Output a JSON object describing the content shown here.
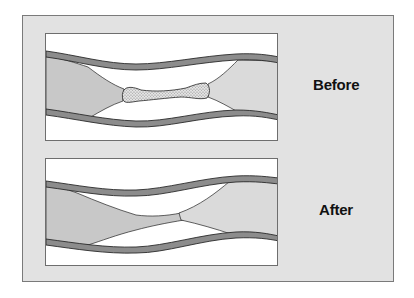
{
  "diagram": {
    "panels": [
      {
        "id": "before",
        "label": "Before",
        "depicts": "artery with plaque narrowing and a blood clot blocking the lumen"
      },
      {
        "id": "after",
        "label": "After",
        "depicts": "artery with plaque narrowing, clot dissolved"
      }
    ]
  },
  "colors": {
    "frame_bg": "#e2e2e2",
    "frame_border": "#7a7a7a",
    "panel_bg": "#ffffff",
    "vessel_wall": "#8a8a8a",
    "vessel_wall_edge": "#333333",
    "plaque": "#cccccc",
    "plaque_light": "#dedede",
    "clot": "#d4d4d4"
  }
}
